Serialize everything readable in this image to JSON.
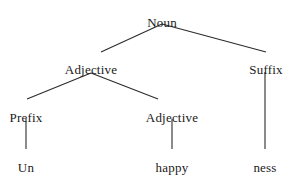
{
  "figure": {
    "name": "morphological-parse-tree",
    "width": 292,
    "height": 180,
    "background_color": "#ffffff",
    "line_color": "#2b2b2b",
    "text_color": "#1a1a1a",
    "word": "Unhappiness"
  },
  "nodes": {
    "root": {
      "label": "Noun",
      "x": 162,
      "y": 15
    },
    "adjective_1": {
      "label": "Adjective",
      "x": 91,
      "y": 62
    },
    "suffix": {
      "label": "Suffix",
      "x": 266,
      "y": 62
    },
    "prefix": {
      "label": "Prefix",
      "x": 26,
      "y": 110
    },
    "adjective_2": {
      "label": "Adjective",
      "x": 172,
      "y": 110
    },
    "leaf_un": {
      "label": "Un",
      "x": 26,
      "y": 160
    },
    "leaf_happy": {
      "label": "happy",
      "x": 172,
      "y": 160
    },
    "leaf_ness": {
      "label": "ness",
      "x": 265,
      "y": 160
    }
  },
  "edges": [
    {
      "name": "edge-noun-adjective",
      "x1": 162,
      "y1": 24,
      "x2": 101,
      "y2": 52
    },
    {
      "name": "edge-noun-suffix",
      "x1": 162,
      "y1": 24,
      "x2": 266,
      "y2": 52
    },
    {
      "name": "edge-adjective-prefix",
      "x1": 91,
      "y1": 73,
      "x2": 27,
      "y2": 99
    },
    {
      "name": "edge-adjective-adjective",
      "x1": 91,
      "y1": 73,
      "x2": 158,
      "y2": 99
    },
    {
      "name": "edge-prefix-un",
      "x1": 26,
      "y1": 119,
      "x2": 26,
      "y2": 149
    },
    {
      "name": "edge-adjective-happy",
      "x1": 172,
      "y1": 119,
      "x2": 172,
      "y2": 149
    },
    {
      "name": "edge-suffix-ness",
      "x1": 265,
      "y1": 72,
      "x2": 265,
      "y2": 149
    }
  ]
}
